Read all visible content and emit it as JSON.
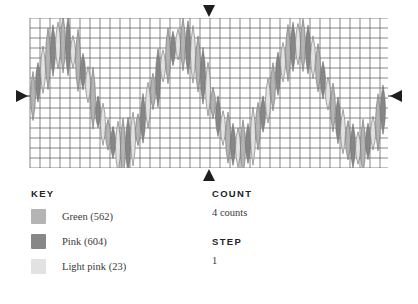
{
  "chart_data": {
    "type": "scatter",
    "title": "",
    "xlabel": "",
    "ylabel": "",
    "grid": true,
    "grid_cell_px": 10,
    "plot_box": {
      "x": 30,
      "y": 18,
      "width": 358,
      "height": 150
    },
    "axis_markers": [
      {
        "name": "left-marker",
        "direction": "right",
        "x": 22,
        "y": 96
      },
      {
        "name": "right-marker",
        "direction": "left",
        "x": 396,
        "y": 96
      },
      {
        "name": "top-marker",
        "direction": "down",
        "x": 209,
        "y": 11
      },
      {
        "name": "bottom-marker",
        "direction": "up",
        "x": 209,
        "y": 175
      }
    ],
    "marker_shape": "lens",
    "marker_width": 10,
    "series_colors": [
      "#b4b4b4",
      "#878787",
      "#e2e2e2"
    ],
    "series_names": [
      "Green",
      "Pink",
      "Light pink"
    ],
    "series_counts": [
      562,
      604,
      23
    ],
    "wave": {
      "cycles": 3,
      "baseline_y": 96,
      "amplitude": 52,
      "points": 71,
      "x_start": 33,
      "x_step": 5,
      "marker_height_min": 30,
      "marker_height_max": 62,
      "jitter_seed": 7
    }
  },
  "key": {
    "heading": "KEY",
    "items": [
      {
        "label": "Green (562)",
        "color": "#b4b4b4",
        "swatch_name": "legend-swatch-green"
      },
      {
        "label": "Pink (604)",
        "color": "#878787",
        "swatch_name": "legend-swatch-pink"
      },
      {
        "label": "Light pink (23)",
        "color": "#e2e2e2",
        "swatch_name": "legend-swatch-light-pink"
      }
    ]
  },
  "meta": {
    "count_heading": "COUNT",
    "count_value": "4 counts",
    "step_heading": "STEP",
    "step_value": "1"
  },
  "theme": {
    "grid_line": "#555555",
    "marker_stroke": "#6e6e6e",
    "text": "#232323",
    "text_muted": "#3a3a3a",
    "background": "#ffffff"
  }
}
